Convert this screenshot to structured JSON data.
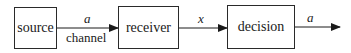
{
  "diagram": {
    "nodes": [
      {
        "id": "source",
        "label": "source"
      },
      {
        "id": "receiver",
        "label": "receiver"
      },
      {
        "id": "decision",
        "label": "decision"
      }
    ],
    "edges": [
      {
        "from": "source",
        "to": "receiver",
        "label_above": "a",
        "label_below": "channel"
      },
      {
        "from": "receiver",
        "to": "decision",
        "label_above": "x"
      },
      {
        "from": "decision",
        "to": "output",
        "label_above": "a"
      }
    ]
  }
}
